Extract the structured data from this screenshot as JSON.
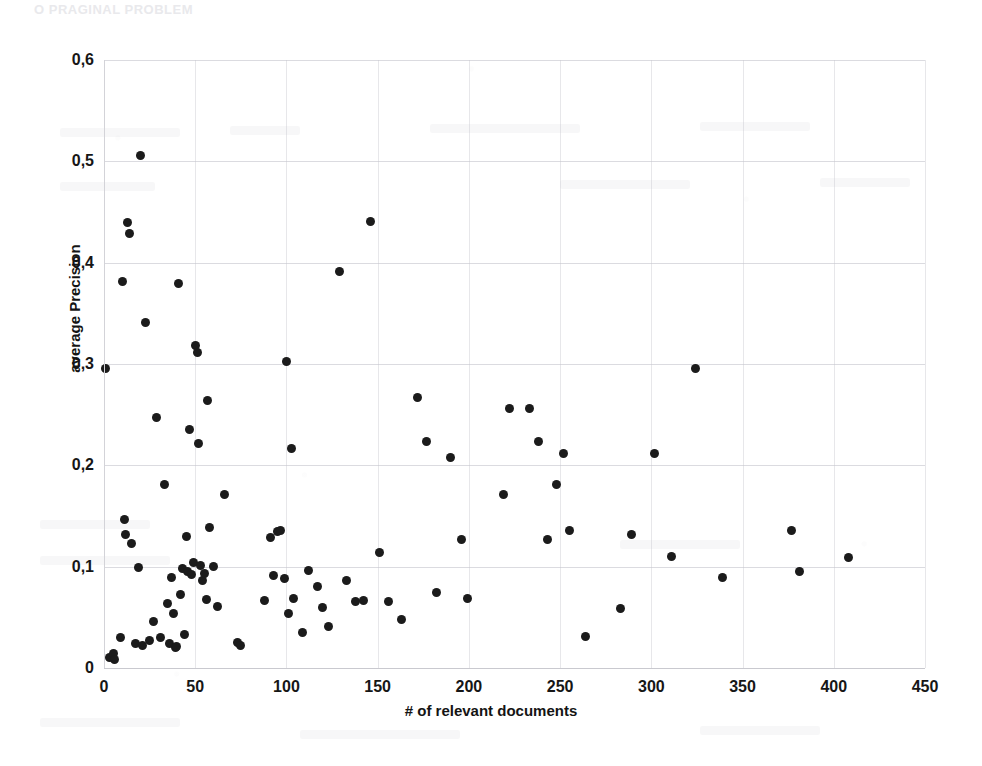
{
  "page": {
    "header_bleed_text": "O    PRAGINAL PROBLEM"
  },
  "axis": {
    "y_title": "average Precision",
    "x_title": "# of relevant documents",
    "y_ticks": [
      "0,6",
      "0,5",
      "0,4",
      "0,3",
      "0,2",
      "0,1",
      "0"
    ],
    "x_ticks": [
      "0",
      "50",
      "100",
      "150",
      "200",
      "250",
      "300",
      "350",
      "400",
      "450"
    ],
    "point_color": "#1b1b1b",
    "gridline_color": "#bebec6"
  },
  "chart_data": {
    "type": "scatter",
    "title": "",
    "xlabel": "# of relevant documents",
    "ylabel": "average Precision",
    "xlim": [
      0,
      450
    ],
    "ylim": [
      0,
      0.6
    ],
    "xticks": [
      0,
      50,
      100,
      150,
      200,
      250,
      300,
      350,
      400,
      450
    ],
    "yticks": [
      0,
      0.1,
      0.2,
      0.3,
      0.4,
      0.5,
      0.6
    ],
    "grid": true,
    "legend": "none",
    "decimal_separator": ",",
    "series": [
      {
        "name": "topics",
        "marker": "filled-circle",
        "color": "#1b1b1b",
        "points": [
          [
            1,
            0.296
          ],
          [
            3,
            0.01
          ],
          [
            5,
            0.014
          ],
          [
            6,
            0.008
          ],
          [
            9,
            0.03
          ],
          [
            10,
            0.381
          ],
          [
            11,
            0.147
          ],
          [
            12,
            0.132
          ],
          [
            13,
            0.44
          ],
          [
            14,
            0.429
          ],
          [
            15,
            0.123
          ],
          [
            17,
            0.024
          ],
          [
            19,
            0.099
          ],
          [
            20,
            0.506
          ],
          [
            21,
            0.022
          ],
          [
            23,
            0.341
          ],
          [
            25,
            0.027
          ],
          [
            27,
            0.046
          ],
          [
            29,
            0.247
          ],
          [
            31,
            0.03
          ],
          [
            33,
            0.181
          ],
          [
            35,
            0.064
          ],
          [
            36,
            0.024
          ],
          [
            37,
            0.089
          ],
          [
            38,
            0.054
          ],
          [
            39,
            0.02
          ],
          [
            40,
            0.021
          ],
          [
            41,
            0.379
          ],
          [
            42,
            0.073
          ],
          [
            43,
            0.098
          ],
          [
            44,
            0.033
          ],
          [
            45,
            0.13
          ],
          [
            46,
            0.095
          ],
          [
            47,
            0.235
          ],
          [
            48,
            0.092
          ],
          [
            49,
            0.104
          ],
          [
            50,
            0.318
          ],
          [
            51,
            0.311
          ],
          [
            52,
            0.222
          ],
          [
            53,
            0.101
          ],
          [
            54,
            0.086
          ],
          [
            55,
            0.093
          ],
          [
            56,
            0.068
          ],
          [
            57,
            0.264
          ],
          [
            58,
            0.139
          ],
          [
            60,
            0.1
          ],
          [
            62,
            0.061
          ],
          [
            66,
            0.171
          ],
          [
            73,
            0.025
          ],
          [
            75,
            0.022
          ],
          [
            88,
            0.067
          ],
          [
            91,
            0.129
          ],
          [
            93,
            0.091
          ],
          [
            95,
            0.135
          ],
          [
            97,
            0.136
          ],
          [
            99,
            0.088
          ],
          [
            100,
            0.302
          ],
          [
            101,
            0.054
          ],
          [
            103,
            0.217
          ],
          [
            104,
            0.069
          ],
          [
            109,
            0.035
          ],
          [
            112,
            0.096
          ],
          [
            117,
            0.08
          ],
          [
            120,
            0.06
          ],
          [
            123,
            0.041
          ],
          [
            129,
            0.391
          ],
          [
            133,
            0.086
          ],
          [
            138,
            0.066
          ],
          [
            142,
            0.067
          ],
          [
            146,
            0.441
          ],
          [
            151,
            0.114
          ],
          [
            156,
            0.066
          ],
          [
            163,
            0.048
          ],
          [
            172,
            0.267
          ],
          [
            177,
            0.224
          ],
          [
            182,
            0.075
          ],
          [
            190,
            0.208
          ],
          [
            196,
            0.127
          ],
          [
            199,
            0.069
          ],
          [
            219,
            0.171
          ],
          [
            222,
            0.256
          ],
          [
            233,
            0.256
          ],
          [
            238,
            0.224
          ],
          [
            243,
            0.127
          ],
          [
            248,
            0.181
          ],
          [
            252,
            0.212
          ],
          [
            255,
            0.136
          ],
          [
            264,
            0.031
          ],
          [
            283,
            0.059
          ],
          [
            289,
            0.132
          ],
          [
            302,
            0.212
          ],
          [
            311,
            0.11
          ],
          [
            324,
            0.296
          ],
          [
            339,
            0.089
          ],
          [
            377,
            0.136
          ],
          [
            381,
            0.095
          ],
          [
            408,
            0.109
          ]
        ]
      }
    ]
  }
}
